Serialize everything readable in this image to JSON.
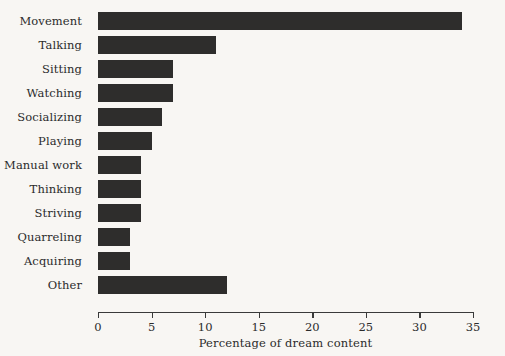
{
  "chart_data": {
    "type": "bar",
    "orientation": "horizontal",
    "title": "",
    "xlabel": "Percentage of dream content",
    "ylabel": "",
    "xlim": [
      0,
      35
    ],
    "xticks": [
      0,
      5,
      10,
      15,
      20,
      25,
      30,
      35
    ],
    "grid": false,
    "legend": null,
    "categories": [
      "Movement",
      "Talking",
      "Sitting",
      "Watching",
      "Socializing",
      "Playing",
      "Manual work",
      "Thinking",
      "Striving",
      "Quarreling",
      "Acquiring",
      "Other"
    ],
    "values": [
      34,
      11,
      7,
      7,
      6,
      5,
      4,
      4,
      4,
      3,
      3,
      12
    ]
  },
  "style": {
    "bar_color": "#2e2d2c",
    "background_color": "#f8f6f3",
    "axis_color": "#3a3a3a",
    "text_color": "#2b2b2b"
  }
}
